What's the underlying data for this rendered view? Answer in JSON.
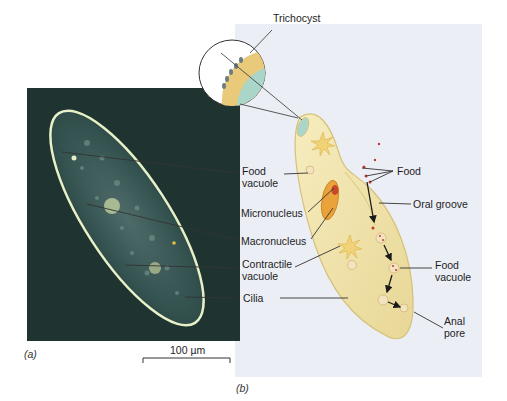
{
  "figure": {
    "panel_a": {
      "caption": "(a)",
      "scale_bar": "100 µm"
    },
    "panel_b": {
      "caption": "(b)"
    },
    "labels": {
      "trichocyst": "Trichocyst",
      "food_vacuole_left": "Food\nvacuole",
      "micronucleus": "Micronucleus",
      "macronucleus": "Macronucleus",
      "contractile_vacuole": "Contractile\nvacuole",
      "cilia": "Cilia",
      "food": "Food",
      "oral_groove": "Oral groove",
      "food_vacuole_right": "Food\nvacuole",
      "anal_pore": "Anal\npore"
    },
    "colors": {
      "photo_bg": "#1f3330",
      "cell_body": "#efe2a6",
      "cell_edge": "#d9c27a",
      "panel_bg": "#eceef6",
      "trichocyst_band": "#e9c97a",
      "inner_teal": "#a9d6c8",
      "food_red": "#c0392b"
    }
  }
}
